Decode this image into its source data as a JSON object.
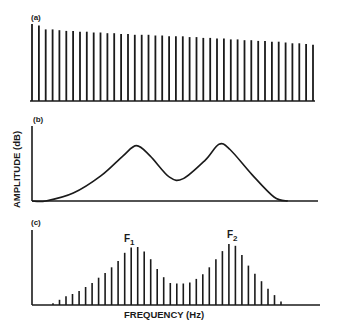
{
  "figure": {
    "panel_a_label": "(a)",
    "panel_b_label": "(b)",
    "panel_c_label": "(c)",
    "y_axis_label": "AMPLITUDE (dB)",
    "x_axis_label": "FREQUENCY (Hz)",
    "formant_1_label": "F",
    "formant_1_sub": "1",
    "formant_2_label": "F",
    "formant_2_sub": "2",
    "ink_color": "#1a1a1a"
  },
  "chart_data": [
    {
      "panel": "a",
      "type": "bar",
      "title": "(a) Source spectrum (harmonics)",
      "xlabel": "FREQUENCY (Hz)",
      "ylabel": "AMPLITUDE (dB)",
      "description": "Evenly spaced harmonic lines with gradually declining amplitude",
      "harmonic_count": 42,
      "values": [
        1.0,
        0.98,
        0.93,
        0.93,
        0.92,
        0.91,
        0.91,
        0.9,
        0.9,
        0.89,
        0.89,
        0.88,
        0.88,
        0.87,
        0.87,
        0.86,
        0.86,
        0.86,
        0.85,
        0.85,
        0.84,
        0.84,
        0.84,
        0.83,
        0.83,
        0.82,
        0.82,
        0.81,
        0.81,
        0.8,
        0.8,
        0.79,
        0.79,
        0.78,
        0.78,
        0.77,
        0.77,
        0.76,
        0.75,
        0.75,
        0.74,
        0.73
      ]
    },
    {
      "panel": "b",
      "type": "line",
      "title": "(b) Vocal tract transfer function",
      "xlabel": "FREQUENCY (Hz)",
      "ylabel": "AMPLITUDE (dB)",
      "description": "Smooth curve with two resonance peaks (formants) and a trough between",
      "x": [
        0.0,
        0.05,
        0.15,
        0.25,
        0.33,
        0.38,
        0.43,
        0.5,
        0.55,
        0.63,
        0.68,
        0.72,
        0.8,
        0.88,
        0.93
      ],
      "y": [
        0.0,
        0.0,
        0.12,
        0.38,
        0.68,
        0.84,
        0.68,
        0.36,
        0.34,
        0.62,
        0.86,
        0.78,
        0.4,
        0.06,
        0.0
      ],
      "peaks": [
        {
          "name": "F1",
          "x": 0.38
        },
        {
          "name": "F2",
          "x": 0.72
        }
      ]
    },
    {
      "panel": "c",
      "type": "bar",
      "title": "(c) Output spectrum",
      "xlabel": "FREQUENCY (Hz)",
      "ylabel": "AMPLITUDE (dB)",
      "description": "Harmonics shaped by the transfer function envelope, peaking at F1 and F2",
      "values": [
        0.03,
        0.09,
        0.15,
        0.19,
        0.24,
        0.31,
        0.38,
        0.47,
        0.55,
        0.65,
        0.76,
        0.9,
        0.99,
        1.0,
        0.92,
        0.79,
        0.62,
        0.48,
        0.38,
        0.37,
        0.37,
        0.39,
        0.45,
        0.53,
        0.65,
        0.79,
        0.93,
        1.05,
        1.02,
        0.86,
        0.68,
        0.54,
        0.41,
        0.28,
        0.17,
        0.06
      ],
      "annotations": [
        {
          "text": "F1",
          "bar_index": 13
        },
        {
          "text": "F2",
          "bar_index": 27
        }
      ]
    }
  ]
}
